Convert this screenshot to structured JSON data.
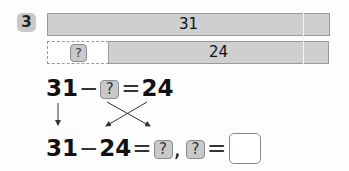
{
  "problem": {
    "number": "3",
    "diagram": {
      "total_bar_label": "31",
      "known_part_label": "24",
      "unknown_part_label": "?"
    },
    "equation_1": {
      "left": "31",
      "op1": "−",
      "unknown": "?",
      "op2": "=",
      "right": "24"
    },
    "equation_2": {
      "left": "31",
      "op1": "−",
      "middle": "24",
      "op2": "=",
      "unknown": "?",
      "separator": ",",
      "unknown_again": "?",
      "op3": "="
    },
    "answer_box": {
      "value": ""
    }
  },
  "colors": {
    "bar_fill": "#cfcfcf",
    "bar_border": "#9a9a9a",
    "badge_fill": "#c9c9c9",
    "text": "#111111"
  }
}
